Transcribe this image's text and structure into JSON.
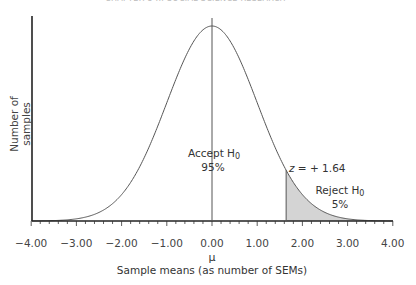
{
  "header": {
    "text": "CHAPTER 8 ... SOCIAL SCIENCE RESEARCH"
  },
  "chart_data": {
    "type": "area",
    "title": "",
    "xlabel": "Sample means (as number of SEMs)",
    "xlabel_symbol": "μ",
    "ylabel": "Number of samples",
    "xlim": [
      -4.0,
      4.0
    ],
    "x_ticks": [
      "−4.00",
      "−3.00",
      "−2.00",
      "−1.00",
      "0.00",
      "1.00",
      "2.00",
      "3.00",
      "4.00"
    ],
    "minor_tick_step": 0.2,
    "grid": false,
    "legend": "none",
    "curve": "standard normal distribution",
    "critical_value": 1.64,
    "shaded_region": {
      "from": 1.64,
      "to": 4.0,
      "fill": "#d4d4d4"
    },
    "annotations": [
      {
        "text": "z = + 1.64",
        "x": 1.64
      },
      {
        "text_main": "Accept H",
        "text_sub": "0",
        "value": "95%",
        "x": 0.0
      },
      {
        "text_main": "Reject H",
        "text_sub": "0",
        "value": "5%",
        "x": 2.5
      }
    ]
  },
  "labels": {
    "z": "z",
    "z_rest": " = + 1.64",
    "accept": "Accept H",
    "accept_sub": "0",
    "accept_pct": "95%",
    "reject": "Reject H",
    "reject_sub": "0",
    "reject_pct": "5%",
    "mu": "μ",
    "xlabel": "Sample means (as number of SEMs)",
    "ylabel": "Number of samples",
    "ticks": [
      "−4.00",
      "−3.00",
      "−2.00",
      "−1.00",
      "0.00",
      "1.00",
      "2.00",
      "3.00",
      "4.00"
    ]
  }
}
